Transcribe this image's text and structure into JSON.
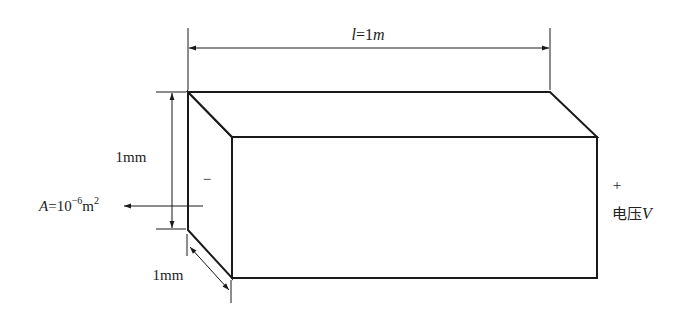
{
  "diagram": {
    "labels": {
      "length_var": "l",
      "length_eq": "=1",
      "length_unit": "m",
      "height": "1mm",
      "depth": "1mm",
      "area_var": "A",
      "area_eq": "=10",
      "area_exp": "−6",
      "area_unit": "m",
      "area_unit_exp": "2",
      "minus": "−",
      "plus": "+",
      "voltage_cn": "电压",
      "voltage_var": "V"
    },
    "colors": {
      "stroke": "#1a1a1a",
      "text": "#222222",
      "background": "#ffffff"
    }
  }
}
